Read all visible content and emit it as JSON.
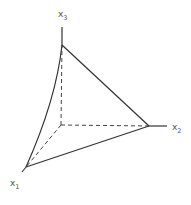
{
  "diagram": {
    "type": "3d-simplex",
    "axes": [
      {
        "name": "x1",
        "label": "x",
        "subscript": "1"
      },
      {
        "name": "x2",
        "label": "x",
        "subscript": "2"
      },
      {
        "name": "x3",
        "label": "x",
        "subscript": "3"
      }
    ],
    "colors": {
      "line": "#333333",
      "label": "#555555",
      "background": "#ffffff"
    }
  }
}
